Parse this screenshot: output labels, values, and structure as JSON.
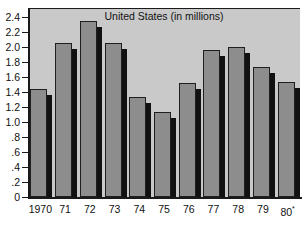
{
  "chart_data": {
    "type": "bar",
    "title": "United States (in millions)",
    "xlabel": "",
    "ylabel": "",
    "ylim": [
      0,
      2.4
    ],
    "grid": false,
    "legend": null,
    "categories": [
      "1970",
      "71",
      "72",
      "73",
      "74",
      "75",
      "76",
      "77",
      "78",
      "79",
      "80"
    ],
    "category_labels": [
      "1970",
      "71",
      "72",
      "73",
      "74",
      "75",
      "76",
      "77",
      "78",
      "79",
      "80*"
    ],
    "values": [
      1.44,
      2.06,
      2.35,
      2.05,
      1.33,
      1.14,
      1.52,
      1.96,
      2.0,
      1.73,
      1.53
    ],
    "ytick_labels": [
      "0",
      ".2",
      ".4",
      ".6",
      ".8",
      "1.0",
      "1.2",
      "1.4",
      "1.6",
      "1.8",
      "2.0",
      "2.2",
      "2.4"
    ],
    "ytick_values": [
      0,
      0.2,
      0.4,
      0.6,
      0.8,
      1.0,
      1.2,
      1.4,
      1.6,
      1.8,
      2.0,
      2.2,
      2.4
    ],
    "footnote_marker": "*"
  },
  "colors": {
    "plot_background": "#c9c9c9",
    "bar_fill": "#8d8d8d",
    "bar_outline": "#1f1f1f",
    "bar_shadow": "#111111",
    "axis": "#1a1a1a",
    "text": "#111111",
    "page_background": "#ffffff"
  }
}
